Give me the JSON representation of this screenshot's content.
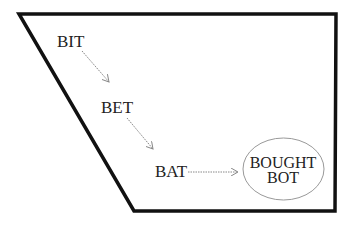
{
  "diagram": {
    "colors": {
      "frame": "#111111",
      "arrow": "#888888",
      "ellipse": "#999999",
      "text": "#222222"
    },
    "nodes": [
      {
        "id": "bit",
        "label": "BIT"
      },
      {
        "id": "bet",
        "label": "BET"
      },
      {
        "id": "bat",
        "label": "BAT"
      },
      {
        "id": "bought_bot",
        "lines": [
          "BOUGHT",
          "BOT"
        ]
      }
    ],
    "edges": [
      {
        "from": "bit",
        "to": "bet"
      },
      {
        "from": "bet",
        "to": "bat"
      },
      {
        "from": "bat",
        "to": "bought_bot"
      }
    ]
  }
}
